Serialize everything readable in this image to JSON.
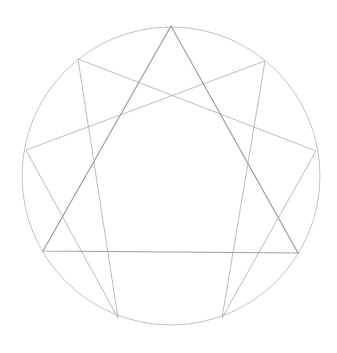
{
  "diagram": {
    "type": "enneagram",
    "width": 337,
    "height": 353,
    "colors": {
      "background": "#ffffff",
      "circle": "#c4c4c4",
      "triangle": "#a0a0a0",
      "hexad": "#bcbcbc"
    },
    "circle": {
      "cx": 171,
      "cy": 176,
      "r": 149
    },
    "points": {
      "9": [
        171,
        26
      ],
      "1": [
        265,
        61
      ],
      "2": [
        316,
        151
      ],
      "3": [
        298,
        253
      ],
      "4": [
        222,
        318
      ],
      "5": [
        118,
        318
      ],
      "6": [
        43,
        251
      ],
      "7": [
        26,
        150
      ],
      "8": [
        78,
        59
      ]
    },
    "triangle": [
      "9",
      "3",
      "6"
    ],
    "hexad": [
      "1",
      "4",
      "2",
      "8",
      "5",
      "7",
      "1"
    ]
  }
}
